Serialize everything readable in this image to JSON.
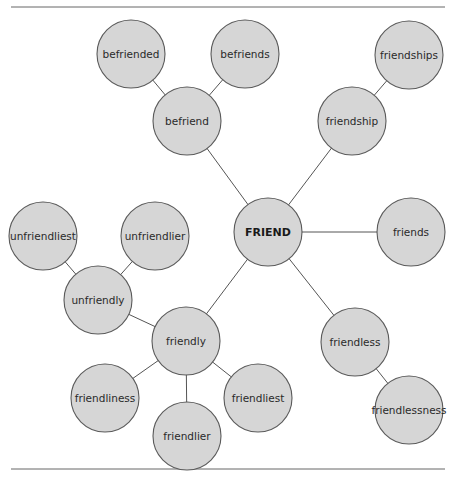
{
  "diagram": {
    "type": "word-family-web",
    "root": "FRIEND",
    "nodes": [
      {
        "id": "friend",
        "label": "FRIEND",
        "root": true
      },
      {
        "id": "befriend",
        "label": "befriend"
      },
      {
        "id": "befriended",
        "label": "befriended"
      },
      {
        "id": "befriends",
        "label": "befriends"
      },
      {
        "id": "friendship",
        "label": "friendship"
      },
      {
        "id": "friendships",
        "label": "friendships"
      },
      {
        "id": "friends",
        "label": "friends"
      },
      {
        "id": "friendless",
        "label": "friendless"
      },
      {
        "id": "friendlessness",
        "label": "friendlessness"
      },
      {
        "id": "friendly",
        "label": "friendly"
      },
      {
        "id": "unfriendly",
        "label": "unfriendly"
      },
      {
        "id": "unfriendliest",
        "label": "unfriendliest"
      },
      {
        "id": "unfriendlier",
        "label": "unfriendlier"
      },
      {
        "id": "friendliness",
        "label": "friendliness"
      },
      {
        "id": "friendlier",
        "label": "friendlier"
      },
      {
        "id": "friendliest",
        "label": "friendliest"
      }
    ],
    "edges": [
      [
        "friend",
        "befriend"
      ],
      [
        "befriend",
        "befriended"
      ],
      [
        "befriend",
        "befriends"
      ],
      [
        "friend",
        "friendship"
      ],
      [
        "friendship",
        "friendships"
      ],
      [
        "friend",
        "friends"
      ],
      [
        "friend",
        "friendless"
      ],
      [
        "friendless",
        "friendlessness"
      ],
      [
        "friend",
        "friendly"
      ],
      [
        "friendly",
        "unfriendly"
      ],
      [
        "unfriendly",
        "unfriendliest"
      ],
      [
        "unfriendly",
        "unfriendlier"
      ],
      [
        "friendly",
        "friendliness"
      ],
      [
        "friendly",
        "friendlier"
      ],
      [
        "friendly",
        "friendliest"
      ]
    ],
    "colors": {
      "node_fill": "#d6d6d6",
      "node_stroke": "#5a5a5a",
      "edge": "#555555",
      "text": "#2a2a2a"
    }
  }
}
